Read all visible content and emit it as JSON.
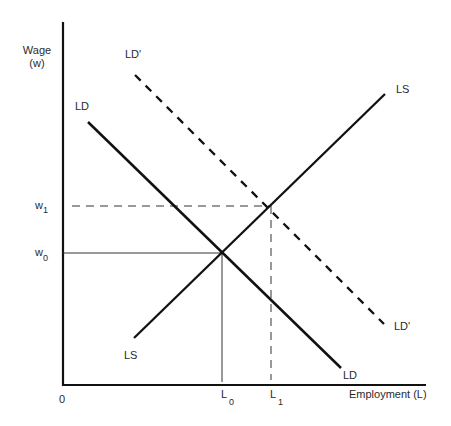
{
  "diagram": {
    "axes": {
      "y_label_line1": "Wage",
      "y_label_line2": "(w)",
      "x_label": "Employment (L)",
      "origin_label": "0"
    },
    "curves": {
      "ld": {
        "label_top": "LD",
        "label_bottom": "LD",
        "style": "solid"
      },
      "ls": {
        "label_top": "LS",
        "label_bottom": "LS",
        "style": "solid"
      },
      "ld_prime": {
        "label_top": "LD'",
        "label_bottom": "LD'",
        "style": "dashed"
      }
    },
    "ticks": {
      "w0": {
        "base": "w",
        "sub": "0"
      },
      "w1": {
        "base": "w",
        "sub": "1"
      },
      "l0": {
        "base": "L",
        "sub": "0"
      },
      "l1": {
        "base": "L",
        "sub": "1"
      }
    },
    "equilibria": [
      {
        "name": "initial",
        "wage": "w0",
        "employment": "L0",
        "guide_style": "solid"
      },
      {
        "name": "new",
        "wage": "w1",
        "employment": "L1",
        "guide_style": "dashed"
      }
    ],
    "colors": {
      "line": "#111111",
      "text": "#2a2a2a",
      "guide": "#333333",
      "background": "#ffffff"
    }
  }
}
